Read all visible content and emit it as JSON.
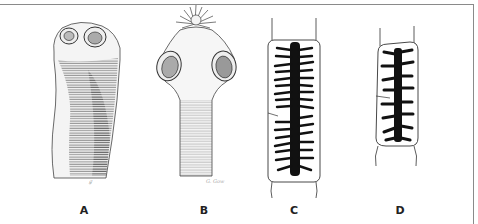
{
  "figure": {
    "panels": [
      {
        "id": "A",
        "label": "A",
        "subject": "scolex with four suckers, unarmed (no hooks)"
      },
      {
        "id": "B",
        "label": "B",
        "subject": "scolex with four suckers and rostellum with crown of hooks"
      },
      {
        "id": "C",
        "label": "C",
        "subject": "gravid proglottid with many fine lateral uterine branches"
      },
      {
        "id": "D",
        "label": "D",
        "subject": "gravid proglottid with fewer, thicker lateral uterine branches"
      }
    ],
    "signature": "G. Gow",
    "colors": {
      "ink": "#111111",
      "border": "#8a8a8a",
      "background": "#ffffff"
    }
  }
}
